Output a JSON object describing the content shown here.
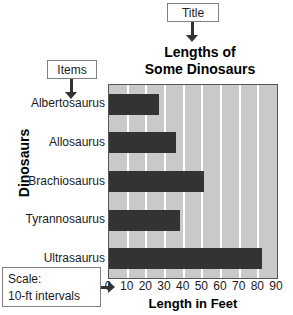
{
  "annotations": {
    "title_callout": "Title",
    "items_callout": "Items",
    "scale_callout_line1": "Scale:",
    "scale_callout_line2": "10-ft intervals"
  },
  "chart_data": {
    "type": "bar",
    "orientation": "horizontal",
    "title": "Lengths of Some Dinosaurs",
    "title_line1": "Lengths of",
    "title_line2": "Some Dinosaurs",
    "xlabel": "Length in Feet",
    "ylabel": "Dinosaurs",
    "categories": [
      "Albertosaurus",
      "Allosaurus",
      "Brachiosaurus",
      "Tyrannosaurus",
      "Ultrasaurus"
    ],
    "values": [
      27,
      36,
      51,
      38,
      82
    ],
    "xlim": [
      0,
      90
    ],
    "xticks": [
      0,
      10,
      20,
      30,
      40,
      50,
      60,
      70,
      80,
      90
    ],
    "tick_interval": 10,
    "grid": true,
    "legend": null,
    "colors": {
      "bar": "#333333",
      "plot_background": "#c9c9c9",
      "gridline": "#ffffff",
      "plot_border": "#555555",
      "callout_border": "#808080",
      "arrow": "#333333",
      "text": "#000000"
    }
  }
}
